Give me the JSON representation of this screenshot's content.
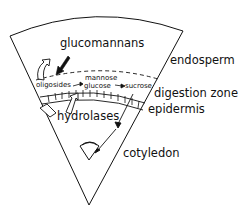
{
  "diagram": {
    "type": "seed-germination-schematic",
    "labels": {
      "glucomannans": "glucomannans",
      "endosperm": "endosperm",
      "digestion_zone": "digestion zone",
      "epidermis": "epidermis",
      "hydrolases": "hydrolases",
      "cotyledon": "cotyledon",
      "oligosides": "oligosides",
      "mannose": "mannose",
      "glucose": "glucose",
      "sucrose": "sucrose"
    },
    "flows": [
      {
        "from": "glucomannans",
        "to": "oligosides"
      },
      {
        "from": "oligosides",
        "to": "glucose"
      },
      {
        "from": "mannose",
        "to": "glucose"
      },
      {
        "from": "glucose",
        "to": "sucrose"
      },
      {
        "from": "sucrose",
        "to": "cotyledon"
      },
      {
        "from": "hydrolases",
        "to": "glucomannans"
      }
    ],
    "colors": {
      "line": "#111111",
      "background": "#ffffff"
    }
  }
}
